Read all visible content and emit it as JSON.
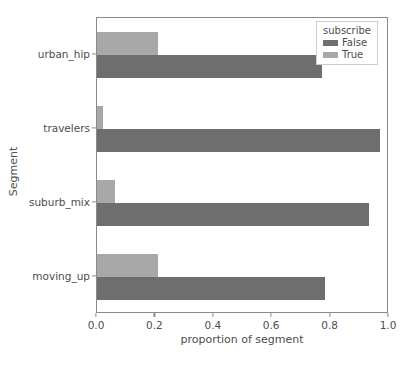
{
  "chart_data": {
    "type": "bar",
    "orientation": "horizontal",
    "title": "",
    "xlabel": "proportion of segment",
    "ylabel": "Segment",
    "categories": [
      "urban_hip",
      "travelers",
      "suburb_mix",
      "moving_up"
    ],
    "series": [
      {
        "name": "False",
        "color": "#6e6e6e",
        "values": [
          0.77,
          0.97,
          0.93,
          0.78
        ]
      },
      {
        "name": "True",
        "color": "#a8a8a8",
        "values": [
          0.21,
          0.02,
          0.06,
          0.21
        ]
      }
    ],
    "xlim": [
      0.0,
      1.0
    ],
    "xticks": [
      "0.0",
      "0.2",
      "0.4",
      "0.6",
      "0.8",
      "1.0"
    ],
    "xtick_values": [
      0.0,
      0.2,
      0.4,
      0.6,
      0.8,
      1.0
    ],
    "grid": false,
    "legend": {
      "title": "subscribe",
      "position": "upper right",
      "entries": [
        {
          "label": "False",
          "color": "#6e6e6e"
        },
        {
          "label": "True",
          "color": "#a8a8a8"
        }
      ]
    },
    "colors": {
      "false_bar": "#6e6e6e",
      "true_bar": "#a8a8a8",
      "axis": "#8a8a8a",
      "text": "#4d4d4d",
      "background": "#ffffff"
    }
  }
}
